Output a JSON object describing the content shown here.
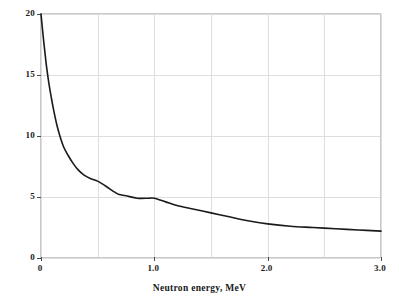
{
  "chart_data": {
    "type": "line",
    "title": "",
    "xlabel": "Neutron energy, MeV",
    "ylabel": "Scattering cross section, barns",
    "xlim": [
      0,
      3.0
    ],
    "ylim": [
      0,
      20
    ],
    "grid": true,
    "legend": "none",
    "xticks": [
      {
        "value": 0,
        "label": "0"
      },
      {
        "value": 1.0,
        "label": "1.0"
      },
      {
        "value": 2.0,
        "label": "2.0"
      },
      {
        "value": 3.0,
        "label": "3.0"
      }
    ],
    "xgridlines": [
      0,
      0.5,
      1.0,
      1.5,
      2.0,
      2.5,
      3.0
    ],
    "yticks": [
      {
        "value": 0,
        "label": "0"
      },
      {
        "value": 5,
        "label": "5"
      },
      {
        "value": 10,
        "label": "10"
      },
      {
        "value": 15,
        "label": "15"
      },
      {
        "value": 20,
        "label": "20"
      }
    ],
    "ygridlines": [
      0,
      5,
      10,
      15,
      20
    ],
    "series": [
      {
        "name": "scattering cross section",
        "color": "#1a1a1a",
        "x": [
          0.0,
          0.02,
          0.04,
          0.05,
          0.07,
          0.09,
          0.11,
          0.14,
          0.17,
          0.2,
          0.24,
          0.28,
          0.33,
          0.38,
          0.44,
          0.5,
          0.57,
          0.65,
          0.69,
          0.75,
          0.85,
          0.95,
          1.0,
          1.1,
          1.2,
          1.35,
          1.5,
          1.65,
          1.8,
          2.0,
          2.2,
          2.4,
          2.6,
          2.8,
          3.0
        ],
        "y": [
          20.0,
          18.1,
          16.4,
          15.6,
          14.3,
          13.2,
          12.2,
          10.9,
          9.9,
          9.1,
          8.4,
          7.8,
          7.2,
          6.8,
          6.5,
          6.3,
          5.9,
          5.4,
          5.2,
          5.1,
          4.9,
          4.9,
          4.9,
          4.6,
          4.3,
          4.0,
          3.7,
          3.4,
          3.1,
          2.8,
          2.6,
          2.5,
          2.4,
          2.3,
          2.2
        ]
      }
    ]
  },
  "axis": {
    "x_title": "Neutron energy, MeV",
    "y_title": "Scattering cross section, barns",
    "x_tick_labels": [
      "0",
      "1.0",
      "2.0",
      "3.0"
    ],
    "y_tick_labels": [
      "0",
      "5",
      "10",
      "15",
      "20"
    ]
  },
  "colors": {
    "curve": "#1a1a1a",
    "grid": "#dedede",
    "frame": "#c9c9c9",
    "text": "#1a1a1a",
    "background": "#ffffff"
  }
}
